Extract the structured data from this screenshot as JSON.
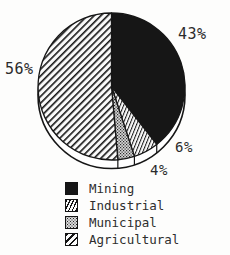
{
  "chart_data": {
    "type": "pie",
    "style": "3d-rim",
    "direction": "clockwise",
    "start_angle_deg": 0,
    "slices": [
      {
        "label": "Mining",
        "value": 43,
        "pct": "43%",
        "pattern": "solid-black"
      },
      {
        "label": "Industrial",
        "value": 6,
        "pct": "6%",
        "pattern": "thin-diagonal-hatch"
      },
      {
        "label": "Municipal",
        "value": 4,
        "pct": "4%",
        "pattern": "gray-stipple"
      },
      {
        "label": "Agricultural",
        "value": 56,
        "pct": "56%",
        "pattern": "wide-diagonal-hatch"
      }
    ],
    "legend_position": "bottom"
  },
  "colors": {
    "ink": "#161616",
    "background": "#fdfdfc",
    "stipple_gray": "#d8d8d8"
  }
}
